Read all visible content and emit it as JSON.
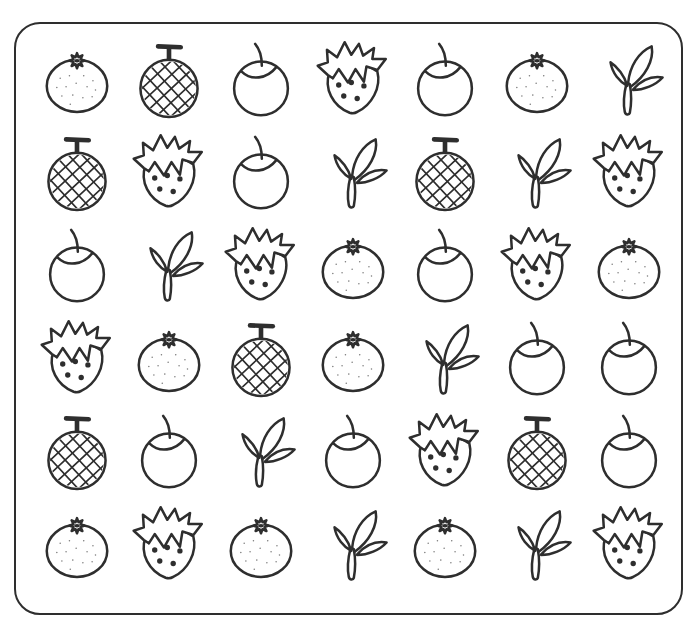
{
  "page": {
    "background": "#ffffff",
    "line_color": "#2e2e2e",
    "border_color": "#2e2e2e"
  },
  "worksheet": {
    "rows": 6,
    "columns": 7,
    "fruit_types": [
      "orange",
      "melon",
      "apple",
      "strawberry",
      "sprout"
    ],
    "cells": [
      [
        "orange",
        "melon",
        "apple",
        "strawberry",
        "apple",
        "orange",
        "sprout"
      ],
      [
        "melon",
        "strawberry",
        "apple",
        "sprout",
        "melon",
        "sprout",
        "strawberry"
      ],
      [
        "apple",
        "sprout",
        "strawberry",
        "orange",
        "apple",
        "strawberry",
        "orange"
      ],
      [
        "strawberry",
        "orange",
        "melon",
        "orange",
        "sprout",
        "apple",
        "apple"
      ],
      [
        "melon",
        "apple",
        "sprout",
        "apple",
        "strawberry",
        "melon",
        "apple"
      ],
      [
        "orange",
        "strawberry",
        "orange",
        "sprout",
        "orange",
        "sprout",
        "strawberry"
      ]
    ]
  }
}
